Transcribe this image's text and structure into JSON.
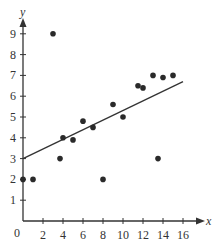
{
  "chart_data": {
    "type": "scatter",
    "title": "",
    "xlabel": "x",
    "ylabel": "y",
    "xlim": [
      0,
      17
    ],
    "ylim": [
      0,
      9.8
    ],
    "x_ticks": [
      2,
      4,
      6,
      8,
      10,
      12,
      14,
      16
    ],
    "y_ticks": [
      1,
      2,
      3,
      4,
      5,
      6,
      7,
      8,
      9
    ],
    "origin_label": "0",
    "grid": false,
    "legend": null,
    "points": [
      {
        "x": 0,
        "y": 2
      },
      {
        "x": 1,
        "y": 2
      },
      {
        "x": 3,
        "y": 9
      },
      {
        "x": 3.7,
        "y": 3
      },
      {
        "x": 4,
        "y": 4
      },
      {
        "x": 5,
        "y": 3.9
      },
      {
        "x": 6,
        "y": 4.8
      },
      {
        "x": 7,
        "y": 4.5
      },
      {
        "x": 8,
        "y": 2
      },
      {
        "x": 9,
        "y": 5.6
      },
      {
        "x": 10,
        "y": 5
      },
      {
        "x": 11.5,
        "y": 6.5
      },
      {
        "x": 12,
        "y": 6.4
      },
      {
        "x": 13,
        "y": 7
      },
      {
        "x": 13.5,
        "y": 3
      },
      {
        "x": 14,
        "y": 6.9
      },
      {
        "x": 15,
        "y": 7
      }
    ],
    "trend_line": {
      "x1": 0,
      "y1": 3,
      "x2": 16,
      "y2": 6.7
    },
    "colors": {
      "points": "#2a2a2a",
      "axes": "#333333",
      "line": "#333333"
    }
  }
}
